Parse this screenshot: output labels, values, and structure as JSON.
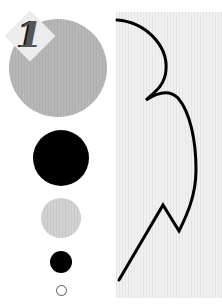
{
  "badge": {
    "number": "1"
  },
  "colors": {
    "large_circle": "#b7b7b7",
    "medium_circle": "#d2d2d2",
    "dark": "#000000",
    "panel": "#f1f1f1"
  },
  "shapes": [
    {
      "name": "large-gray-circle"
    },
    {
      "name": "large-black-circle"
    },
    {
      "name": "medium-gray-circle"
    },
    {
      "name": "small-black-circle"
    },
    {
      "name": "small-outline-circle"
    }
  ]
}
